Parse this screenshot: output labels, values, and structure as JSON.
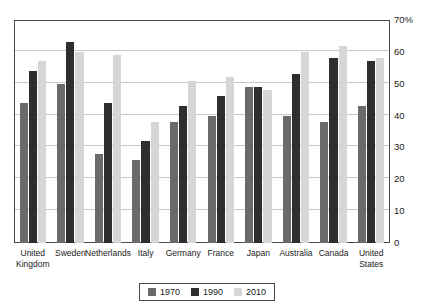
{
  "chart_data": {
    "type": "bar",
    "title": "",
    "xlabel": "",
    "ylabel": "",
    "ylim": [
      0,
      70
    ],
    "yunit": "%",
    "grid": true,
    "legend_position": "bottom",
    "categories": [
      "United Kingdom",
      "Sweden",
      "Netherlands",
      "Italy",
      "Germany",
      "France",
      "Japan",
      "Australia",
      "Canada",
      "United States"
    ],
    "category_lines": [
      [
        "United",
        "Kingdom"
      ],
      [
        "Sweden",
        ""
      ],
      [
        "Netherlands",
        ""
      ],
      [
        "Italy",
        ""
      ],
      [
        "Germany",
        ""
      ],
      [
        "France",
        ""
      ],
      [
        "Japan",
        ""
      ],
      [
        "Australia",
        ""
      ],
      [
        "Canada",
        ""
      ],
      [
        "United",
        "States"
      ]
    ],
    "series": [
      {
        "name": "1970",
        "color": "#6a6a6a",
        "values": [
          44,
          50,
          28,
          26,
          38,
          40,
          49,
          40,
          38,
          43
        ]
      },
      {
        "name": "1990",
        "color": "#2e2e2e",
        "values": [
          54,
          63,
          44,
          32,
          43,
          46,
          49,
          53,
          58,
          57
        ]
      },
      {
        "name": "2010",
        "color": "#d6d6d6",
        "values": [
          57,
          60,
          59,
          38,
          51,
          52,
          48,
          60,
          62,
          58
        ]
      }
    ],
    "yticks": [
      {
        "value": 70,
        "label": "70%"
      },
      {
        "value": 60,
        "label": "60"
      },
      {
        "value": 50,
        "label": "50"
      },
      {
        "value": 40,
        "label": "40"
      },
      {
        "value": 30,
        "label": "30"
      },
      {
        "value": 20,
        "label": "20"
      },
      {
        "value": 10,
        "label": "10"
      },
      {
        "value": 0,
        "label": "0"
      }
    ],
    "legend": [
      {
        "label": "1970",
        "color": "#6a6a6a"
      },
      {
        "label": "1990",
        "color": "#2e2e2e"
      },
      {
        "label": "2010",
        "color": "#d6d6d6"
      }
    ]
  },
  "colors": {
    "series_1970": "#6a6a6a",
    "series_1990": "#2e2e2e",
    "series_2010": "#d6d6d6",
    "frame": "#4a4a4a",
    "gridline": "#c8c8c8",
    "background": "#ffffff"
  }
}
